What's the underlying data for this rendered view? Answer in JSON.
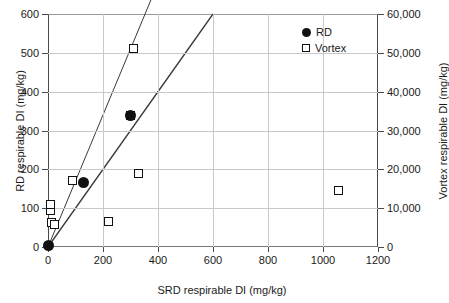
{
  "chart_data": {
    "type": "scatter",
    "title": "",
    "xlabel": "SRD respirable DI (mg/kg)",
    "ylabel": "RD respirable DI (mg/kg)",
    "ylabel_right": "Vortex respirable DI (mg/kg)",
    "xlim": [
      0,
      1200
    ],
    "ylim": [
      0,
      600
    ],
    "ylim_right": [
      0,
      60000
    ],
    "xticks": [
      0,
      200,
      400,
      600,
      800,
      1000,
      1200
    ],
    "xticklabels": [
      "0",
      "200",
      "400",
      "600",
      "800",
      "1000",
      "1200"
    ],
    "yticks": [
      0,
      100,
      200,
      300,
      400,
      500,
      600
    ],
    "yticklabels": [
      "0",
      "100",
      "200",
      "300",
      "400",
      "500",
      "600"
    ],
    "yticks_right": [
      0,
      10000,
      20000,
      30000,
      40000,
      50000,
      60000
    ],
    "yticklabels_right": [
      "0",
      "10,000",
      "20,000",
      "30,000",
      "40,000",
      "50,000",
      "60,000"
    ],
    "grid": true,
    "legend_position": "top-right",
    "series": [
      {
        "name": "RD",
        "marker": "filled-circle",
        "axis": "left",
        "color": "#111111",
        "points": [
          {
            "x": 3,
            "y": 3
          },
          {
            "x": 130,
            "y": 165
          },
          {
            "x": 300,
            "y": 338
          }
        ]
      },
      {
        "name": "Vortex",
        "marker": "open-square",
        "axis": "right",
        "color": "#111111",
        "points": [
          {
            "x": 8,
            "y": 9500
          },
          {
            "x": 10,
            "y": 11000
          },
          {
            "x": 14,
            "y": 6200
          },
          {
            "x": 22,
            "y": 5800
          },
          {
            "x": 90,
            "y": 17000
          },
          {
            "x": 220,
            "y": 6500
          },
          {
            "x": 300,
            "y": 33800
          },
          {
            "x": 310,
            "y": 51000
          },
          {
            "x": 330,
            "y": 19000
          },
          {
            "x": 1055,
            "y": 14500
          }
        ]
      }
    ],
    "trendlines": [
      {
        "name": "rd-trendline",
        "x0": 0,
        "y0": 0,
        "x1": 600,
        "y1": 600,
        "axis": "left"
      },
      {
        "name": "vortex-trendline",
        "x0": 0,
        "y0": 0,
        "x1": 1000,
        "y1": 1700,
        "axis": "left"
      }
    ]
  },
  "legend": {
    "items": [
      {
        "label": "RD",
        "marker": "filled-circle"
      },
      {
        "label": "Vortex",
        "marker": "open-square"
      }
    ]
  }
}
